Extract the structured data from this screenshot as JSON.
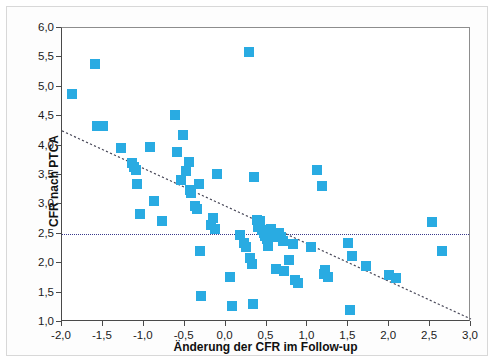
{
  "chart_data": {
    "type": "scatter",
    "title": "",
    "xlabel": "Änderung der CFR im Follow-up",
    "ylabel": "CFR nach PTCA",
    "xlim": [
      -2.0,
      3.0
    ],
    "ylim": [
      1.0,
      6.0
    ],
    "grid": false,
    "legend": null,
    "marker_color": "#29ABE2",
    "marker_shape": "square",
    "xticks": [
      -2.0,
      -1.5,
      -1.0,
      -0.5,
      0.0,
      0.5,
      1.0,
      1.5,
      2.0,
      2.5,
      3.0
    ],
    "xtick_labels": [
      "-2,0",
      "-1,5",
      "-1,0",
      "-0,5",
      "0,0",
      "0,5",
      "1,0",
      "1,5",
      "2,0",
      "2,5",
      "3,0"
    ],
    "yticks": [
      1.0,
      1.5,
      2.0,
      2.5,
      3.0,
      3.5,
      4.0,
      4.5,
      5.0,
      5.5,
      6.0
    ],
    "ytick_labels": [
      "1,0",
      "1,5",
      "2,0",
      "2,5",
      "3,0",
      "3,5",
      "4,0",
      "4,5",
      "5,0",
      "5,5",
      "6,0"
    ],
    "reference_line": {
      "orientation": "horizontal",
      "y": 2.5,
      "style": "dotted",
      "color": "#3a3a8c"
    },
    "trend_line": {
      "style": "dashed",
      "color": "#4a4a5a",
      "x0": -2.0,
      "y0": 4.25,
      "x1": 3.0,
      "y1": 1.05
    },
    "points": [
      [
        -1.88,
        4.87
      ],
      [
        -1.6,
        5.39
      ],
      [
        -1.57,
        4.33
      ],
      [
        -1.5,
        4.34
      ],
      [
        -1.28,
        3.96
      ],
      [
        -1.15,
        3.7
      ],
      [
        -1.12,
        3.63
      ],
      [
        -1.1,
        3.58
      ],
      [
        -1.08,
        3.34
      ],
      [
        -1.05,
        2.83
      ],
      [
        -0.92,
        3.97
      ],
      [
        -0.88,
        3.05
      ],
      [
        -0.78,
        2.72
      ],
      [
        -0.62,
        4.52
      ],
      [
        -0.6,
        3.89
      ],
      [
        -0.55,
        3.42
      ],
      [
        -0.52,
        4.18
      ],
      [
        -0.48,
        3.56
      ],
      [
        -0.45,
        3.72
      ],
      [
        -0.43,
        3.24
      ],
      [
        -0.42,
        3.19
      ],
      [
        -0.38,
        2.97
      ],
      [
        -0.35,
        2.93
      ],
      [
        -0.33,
        3.35
      ],
      [
        -0.31,
        2.21
      ],
      [
        -0.3,
        1.45
      ],
      [
        -0.18,
        2.65
      ],
      [
        -0.15,
        2.77
      ],
      [
        -0.13,
        2.58
      ],
      [
        -0.1,
        3.52
      ],
      [
        0.05,
        1.76
      ],
      [
        0.08,
        1.27
      ],
      [
        0.18,
        2.48
      ],
      [
        0.22,
        2.35
      ],
      [
        0.25,
        2.28
      ],
      [
        0.28,
        5.6
      ],
      [
        0.3,
        2.08
      ],
      [
        0.32,
        1.99
      ],
      [
        0.33,
        1.3
      ],
      [
        0.35,
        3.46
      ],
      [
        0.38,
        2.74
      ],
      [
        0.4,
        2.62
      ],
      [
        0.42,
        2.71
      ],
      [
        0.45,
        2.56
      ],
      [
        0.47,
        2.52
      ],
      [
        0.48,
        2.47
      ],
      [
        0.5,
        2.42
      ],
      [
        0.52,
        2.3
      ],
      [
        0.55,
        2.58
      ],
      [
        0.57,
        2.5
      ],
      [
        0.6,
        2.44
      ],
      [
        0.62,
        1.9
      ],
      [
        0.65,
        2.52
      ],
      [
        0.68,
        2.45
      ],
      [
        0.7,
        2.37
      ],
      [
        0.72,
        1.86
      ],
      [
        0.78,
        2.05
      ],
      [
        0.82,
        2.32
      ],
      [
        0.85,
        1.72
      ],
      [
        0.88,
        1.67
      ],
      [
        1.05,
        2.28
      ],
      [
        1.12,
        3.58
      ],
      [
        1.18,
        3.31
      ],
      [
        1.2,
        1.82
      ],
      [
        1.22,
        1.88
      ],
      [
        1.25,
        1.77
      ],
      [
        1.5,
        2.34
      ],
      [
        1.52,
        1.2
      ],
      [
        1.55,
        2.13
      ],
      [
        1.72,
        1.95
      ],
      [
        2.0,
        1.8
      ],
      [
        2.08,
        1.75
      ],
      [
        2.52,
        2.7
      ],
      [
        2.65,
        2.2
      ]
    ]
  }
}
